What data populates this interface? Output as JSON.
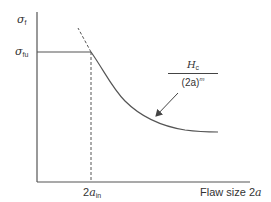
{
  "diagram": {
    "type": "flaw-size-strength",
    "y_axis": {
      "label_symbol": "σ",
      "label_subscript": "f",
      "tick_symbol": "σ",
      "tick_subscript": "fu"
    },
    "x_axis": {
      "label": "Flaw size 2a",
      "label_text": "Flaw size ",
      "label_var": "2a",
      "tick_prefix": "2",
      "tick_var": "a",
      "tick_subscript": "in"
    },
    "annotation": {
      "numerator_var": "H",
      "numerator_subscript": "c",
      "denominator_base": "(2a)",
      "denominator_exponent": "m"
    },
    "colors": {
      "line": "#444444",
      "text": "#333333"
    }
  }
}
